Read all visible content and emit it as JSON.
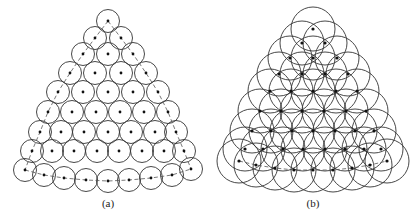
{
  "figure": {
    "panels": [
      {
        "id": "a",
        "label": "(a)",
        "label_x": 108,
        "radius": 11.5,
        "node_radius": 1.4,
        "rows": [
          [
            [
              108,
              21
            ]
          ],
          [
            [
              95,
              38
            ],
            [
              121,
              38
            ]
          ],
          [
            [
              83,
              54
            ],
            [
              108,
              54
            ],
            [
              133,
              54
            ]
          ],
          [
            [
              70,
              73
            ],
            [
              95,
              73
            ],
            [
              121,
              73
            ],
            [
              146,
              73
            ]
          ],
          [
            [
              58,
              92
            ],
            [
              83,
              92
            ],
            [
              108,
              92
            ],
            [
              133,
              92
            ],
            [
              158,
              92
            ]
          ],
          [
            [
              48,
              112
            ],
            [
              72,
              112
            ],
            [
              96,
              112
            ],
            [
              120,
              112
            ],
            [
              144,
              112
            ],
            [
              168,
              112
            ]
          ],
          [
            [
              40,
              132
            ],
            [
              61,
              132
            ],
            [
              84,
              132
            ],
            [
              108,
              132
            ],
            [
              131,
              132
            ],
            [
              155,
              132
            ],
            [
              176,
              132
            ]
          ],
          [
            [
              32,
              151
            ],
            [
              52,
              151
            ],
            [
              74,
              151
            ],
            [
              97,
              151
            ],
            [
              119,
              151
            ],
            [
              142,
              151
            ],
            [
              164,
              151
            ],
            [
              184,
              151
            ]
          ],
          [
            [
              25,
              170
            ],
            [
              44,
              175
            ],
            [
              64,
              178
            ],
            [
              86,
              180
            ],
            [
              108,
              181
            ],
            [
              129,
              180
            ],
            [
              151,
              178
            ],
            [
              172,
              175
            ],
            [
              191,
              169
            ]
          ]
        ],
        "dashed_paths": [
          [
            [
              108,
              21
            ],
            [
              95,
              38
            ],
            [
              83,
              54
            ],
            [
              70,
              73
            ],
            [
              58,
              92
            ],
            [
              48,
              112
            ],
            [
              40,
              132
            ],
            [
              32,
              151
            ],
            [
              25,
              170
            ]
          ],
          [
            [
              108,
              21
            ],
            [
              121,
              38
            ],
            [
              133,
              54
            ],
            [
              146,
              73
            ],
            [
              158,
              92
            ],
            [
              168,
              112
            ],
            [
              176,
              132
            ],
            [
              184,
              151
            ],
            [
              191,
              169
            ]
          ],
          [
            [
              25,
              170
            ],
            [
              44,
              175
            ],
            [
              64,
              178
            ],
            [
              86,
              180
            ],
            [
              108,
              181
            ],
            [
              129,
              180
            ],
            [
              151,
              178
            ],
            [
              172,
              175
            ],
            [
              191,
              169
            ]
          ]
        ]
      },
      {
        "id": "b",
        "label": "(b)",
        "label_x": 313,
        "radius": 22,
        "node_radius": 1.6,
        "rows": [
          [
            [
              313,
              29
            ]
          ],
          [
            [
              302,
              43
            ],
            [
              325,
              43
            ]
          ],
          [
            [
              290,
              58
            ],
            [
              313,
              58
            ],
            [
              337,
              58
            ]
          ],
          [
            [
              279,
              74
            ],
            [
              302,
              74
            ],
            [
              325,
              74
            ],
            [
              348,
              74
            ]
          ],
          [
            [
              270,
              91
            ],
            [
              291,
              91
            ],
            [
              313,
              91
            ],
            [
              336,
              91
            ],
            [
              357,
              91
            ]
          ],
          [
            [
              260,
              111
            ],
            [
              281,
              111
            ],
            [
              302,
              111
            ],
            [
              324,
              111
            ],
            [
              346,
              111
            ],
            [
              366,
              111
            ]
          ],
          [
            [
              252,
              131
            ],
            [
              271,
              131
            ],
            [
              292,
              131
            ],
            [
              313,
              131
            ],
            [
              335,
              131
            ],
            [
              355,
              131
            ],
            [
              374,
              131
            ]
          ],
          [
            [
              245,
              149
            ],
            [
              263,
              149
            ],
            [
              283,
              149
            ],
            [
              303,
              149
            ],
            [
              325,
              149
            ],
            [
              345,
              149
            ],
            [
              364,
              149
            ],
            [
              381,
              149
            ]
          ],
          [
            [
              239,
              161
            ],
            [
              256,
              165
            ],
            [
              275,
              168
            ],
            [
              294,
              170
            ],
            [
              313,
              170
            ],
            [
              333,
              170
            ],
            [
              352,
              168
            ],
            [
              370,
              165
            ],
            [
              387,
              161
            ]
          ]
        ],
        "dashed_paths": [
          [
            [
              239,
              161
            ],
            [
              256,
              165
            ],
            [
              275,
              168
            ],
            [
              294,
              170
            ],
            [
              313,
              170
            ],
            [
              333,
              170
            ],
            [
              352,
              168
            ],
            [
              370,
              165
            ],
            [
              387,
              161
            ]
          ]
        ]
      }
    ]
  }
}
